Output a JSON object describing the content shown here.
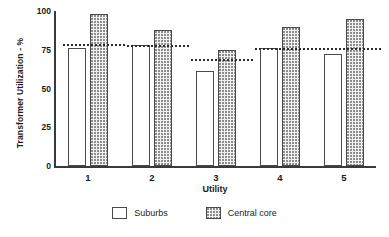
{
  "chart_data": {
    "type": "bar",
    "title": "",
    "subtitle": "",
    "xlabel": "Utility",
    "ylabel": "Transformer Utilization - %",
    "categories": [
      "1",
      "2",
      "3",
      "4",
      "5"
    ],
    "ylim": [
      0,
      100
    ],
    "yticks": [
      0,
      25,
      50,
      75,
      100
    ],
    "ytick_labels": [
      "0",
      "25",
      "50",
      "75",
      "100"
    ],
    "grid": false,
    "legend_position": "bottom",
    "series": [
      {
        "name": "Suburbs",
        "fill": "white",
        "values": [
          76,
          78,
          61,
          76,
          72
        ]
      },
      {
        "name": "Central core",
        "fill": "dotted",
        "values": [
          98,
          88,
          75,
          90,
          95
        ]
      }
    ],
    "reference_lines": {
      "name": "Utility average",
      "style": "dotted",
      "values": [
        79,
        78,
        69,
        76,
        76
      ]
    },
    "colors": {
      "axis": "#3a3a3a",
      "bar_outline": "#4a4a4a",
      "suburbs_fill": "#ffffff",
      "core_fill": "#f2f2f2",
      "core_pattern": "#8c8c8c",
      "reference_line": "#2b2b2b",
      "text": "#1a1a1a"
    }
  },
  "legend": {
    "entries": [
      {
        "label": "Suburbs"
      },
      {
        "label": "Central core"
      }
    ]
  }
}
